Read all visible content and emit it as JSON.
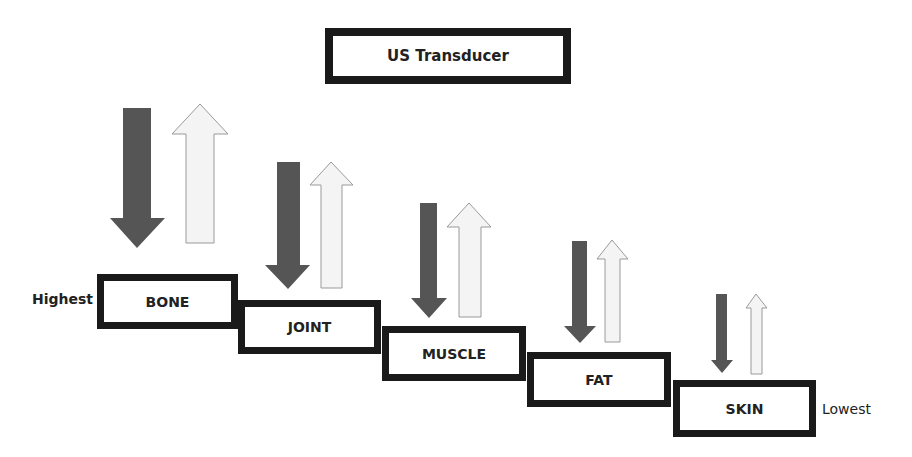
{
  "title": "US Transducer",
  "scale": {
    "high_label": "Highest",
    "low_label": "Lowest"
  },
  "colors": {
    "border": "#1a1a1a",
    "down_arrow": "#555555",
    "up_arrow_fill": "#f4f4f4",
    "up_arrow_stroke": "#9a9a9a"
  },
  "tissues": [
    {
      "label": "BONE"
    },
    {
      "label": "JOINT"
    },
    {
      "label": "MUSCLE"
    },
    {
      "label": "FAT"
    },
    {
      "label": "SKIN"
    }
  ]
}
